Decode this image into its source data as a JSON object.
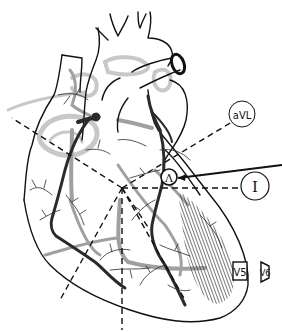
{
  "figure": {
    "colors": {
      "outline": "#111111",
      "artery_dark": "#2a2a2a",
      "vessel_gray": "#9a9a9a",
      "vessel_light": "#c4c4c4",
      "lead_line": "#111111",
      "background": "#ffffff"
    }
  },
  "leads": {
    "aVL": {
      "label": "aVL",
      "shape": "circle"
    },
    "I": {
      "label": "I",
      "shape": "circle"
    },
    "V5": {
      "label": "V5",
      "shape": "box"
    },
    "V6": {
      "label": "V6",
      "shape": "box-skewed"
    }
  },
  "electrode_marker": {
    "label": "Ʌ"
  },
  "infarct_region": {
    "pattern": "diagonal-hatching",
    "location": "lateral-left-ventricle"
  }
}
